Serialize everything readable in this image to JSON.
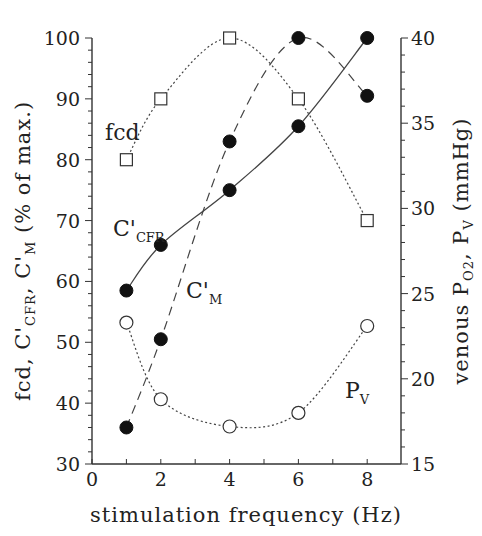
{
  "chart_data": {
    "type": "line",
    "title": "",
    "xlabel": "stimulation frequency (Hz)",
    "ylabel": "fcd, C'CFR, C'M (% of max.)",
    "y2label": "venous PO2, PV (mmHg)",
    "xlim": [
      0,
      9
    ],
    "ylim": [
      30,
      100
    ],
    "y2lim": [
      15,
      40
    ],
    "x_ticks": [
      0,
      2,
      4,
      6,
      8
    ],
    "y_ticks": [
      30,
      40,
      50,
      60,
      70,
      80,
      90,
      100
    ],
    "y2_ticks": [
      15,
      20,
      25,
      30,
      35,
      40
    ],
    "grid": false,
    "legend": "inline labels",
    "x": [
      1,
      2,
      4,
      6,
      8
    ],
    "series": [
      {
        "name": "fcd",
        "axis": "left",
        "marker": "open-square",
        "line": "dotted",
        "values": [
          80,
          90,
          100,
          90,
          70
        ]
      },
      {
        "name": "C'CFR",
        "axis": "left",
        "marker": "filled-circle",
        "line": "solid",
        "values": [
          58.5,
          66,
          75,
          85.5,
          100
        ]
      },
      {
        "name": "C'M",
        "axis": "left",
        "marker": "filled-circle",
        "line": "dashed",
        "values": [
          36,
          50.5,
          83,
          100,
          90.5
        ]
      },
      {
        "name": "PV",
        "axis": "right",
        "marker": "open-circle",
        "line": "dotted",
        "values": [
          23.3,
          18.8,
          17.2,
          18.0,
          23.1
        ]
      }
    ]
  },
  "labels": {
    "x_axis_title": "stimulation frequency (Hz)",
    "y_left_parts": [
      "fcd, C'",
      "CFR",
      ", C'",
      "M",
      " (% of max.)"
    ],
    "y_right_parts": [
      "venous P",
      "O2",
      ", P",
      "V",
      " (mmHg)"
    ],
    "fcd": "fcd",
    "ccfr_main": "C'",
    "ccfr_sub": "CFR",
    "cm_main": "C'",
    "cm_sub": "M",
    "pv_main": "P",
    "pv_sub": "V"
  }
}
